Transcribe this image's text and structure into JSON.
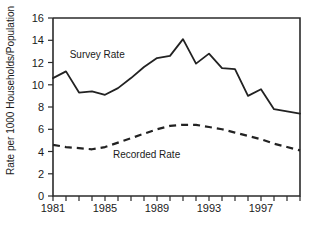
{
  "chart_data": {
    "type": "line",
    "title": "",
    "subtitle": "",
    "xlabel": "",
    "ylabel": "Rate per 1000 Households/Population",
    "xlim": [
      1981,
      2000
    ],
    "ylim": [
      0,
      16
    ],
    "grid": false,
    "legend_position": "inline-annotation",
    "y_ticks": [
      0,
      2,
      4,
      6,
      8,
      10,
      12,
      14,
      16
    ],
    "y_tick_labels": [
      "0",
      "2",
      "4",
      "6",
      "8",
      "10",
      "12",
      "14",
      "16"
    ],
    "x_ticks": [
      1981,
      1982,
      1983,
      1984,
      1985,
      1986,
      1987,
      1988,
      1989,
      1990,
      1991,
      1992,
      1993,
      1994,
      1995,
      1996,
      1997,
      1998,
      1999,
      2000
    ],
    "x_tick_labels": [
      "1981",
      "",
      "",
      "",
      "1985",
      "",
      "",
      "",
      "1989",
      "",
      "",
      "",
      "1993",
      "",
      "",
      "",
      "1997",
      "",
      "",
      ""
    ],
    "x_major_labels": [
      "1981",
      "1985",
      "1989",
      "1993",
      "1997"
    ],
    "x": [
      1981,
      1982,
      1983,
      1984,
      1985,
      1986,
      1987,
      1988,
      1989,
      1990,
      1991,
      1992,
      1993,
      1994,
      1995,
      1996,
      1997,
      1998,
      1999,
      2000
    ],
    "series": [
      {
        "name": "Survey Rate",
        "style": "solid",
        "color": "#222222",
        "annotation": "Survey Rate",
        "values": [
          10.6,
          11.2,
          9.3,
          9.4,
          9.1,
          9.7,
          10.6,
          11.6,
          12.4,
          12.6,
          14.1,
          11.9,
          12.8,
          11.5,
          11.4,
          9.0,
          9.6,
          7.8,
          7.6,
          7.4
        ]
      },
      {
        "name": "Recorded Rate",
        "style": "dashed",
        "color": "#222222",
        "annotation": "Recorded Rate",
        "values": [
          4.6,
          4.4,
          4.3,
          4.2,
          4.4,
          4.8,
          5.2,
          5.6,
          6.0,
          6.3,
          6.4,
          6.4,
          6.2,
          6.0,
          5.7,
          5.4,
          5.1,
          4.7,
          4.4,
          4.1
        ]
      }
    ],
    "annotations": [
      {
        "text": "Survey Rate",
        "x": 1984.4,
        "y": 12.4
      },
      {
        "text": "Recorded Rate",
        "x": 1988.2,
        "y": 3.4
      }
    ]
  }
}
